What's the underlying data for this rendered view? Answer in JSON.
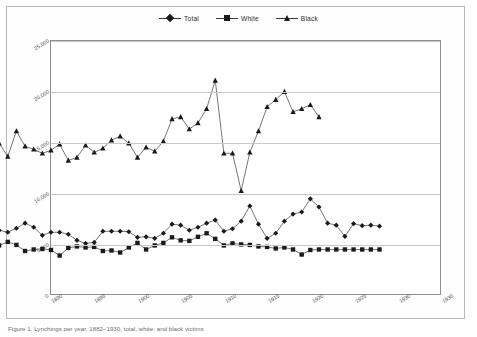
{
  "figure": {
    "caption": "Figure 1. Lynchings per year, 1882–1930, total, white, and black victims"
  },
  "legend": {
    "position": "top-center",
    "items": [
      {
        "label": "Total",
        "marker": "diamond",
        "color": "#1a1a1a"
      },
      {
        "label": "White",
        "marker": "square",
        "color": "#1a1a1a"
      },
      {
        "label": "Black",
        "marker": "triangle",
        "color": "#1a1a1a"
      }
    ]
  },
  "axes": {
    "y_ticks": [
      "0",
      "5,000",
      "10,000",
      "15,000",
      "20,000",
      "25,000"
    ],
    "x_ticks": [
      "1890",
      "1895",
      "1900",
      "1905",
      "1910",
      "1915",
      "1920",
      "1925",
      "1930",
      "1935"
    ],
    "grid": true
  },
  "chart_data": {
    "type": "line",
    "title": "",
    "xlabel": "",
    "ylabel": "",
    "xlim": [
      1890,
      1935
    ],
    "ylim": [
      0,
      25000
    ],
    "ytick_values": [
      0,
      5000,
      10000,
      15000,
      20000,
      25000
    ],
    "xtick_values": [
      1890,
      1895,
      1900,
      1905,
      1910,
      1915,
      1920,
      1925,
      1930,
      1935
    ],
    "grid": true,
    "legend_position": "top-center",
    "x": [
      1884,
      1885,
      1886,
      1887,
      1888,
      1889,
      1890,
      1891,
      1892,
      1893,
      1894,
      1895,
      1896,
      1897,
      1898,
      1899,
      1900,
      1901,
      1902,
      1903,
      1904,
      1905,
      1906,
      1907,
      1908,
      1909,
      1910,
      1911,
      1912,
      1913,
      1914,
      1915,
      1916,
      1917,
      1918,
      1919,
      1920,
      1921,
      1922,
      1923,
      1924,
      1925,
      1926,
      1927,
      1928
    ],
    "series": [
      {
        "name": "Total",
        "marker": "diamond",
        "color": "#1a1a1a",
        "values": [
          6300,
          6100,
          6500,
          7000,
          6600,
          5800,
          6100,
          6100,
          5900,
          5300,
          5000,
          5100,
          6200,
          6200,
          6200,
          6150,
          5600,
          5650,
          5500,
          6000,
          6900,
          6800,
          6300,
          6600,
          7000,
          7300,
          6200,
          6450,
          7200,
          8700,
          6900,
          5500,
          6000,
          7200,
          7900,
          8100,
          9400,
          8600,
          7000,
          6800,
          5700,
          6950,
          6750,
          6800,
          6700
        ],
        "values_note": "read from diamond markers against 5,000-interval gridlines"
      },
      {
        "name": "White",
        "marker": "square",
        "color": "#1a1a1a",
        "values": [
          4800,
          5150,
          4850,
          4250,
          4400,
          4450,
          4350,
          3800,
          4550,
          4700,
          4600,
          4650,
          4250,
          4300,
          4100,
          4600,
          5050,
          4400,
          4800,
          5050,
          5600,
          5300,
          5250,
          5650,
          6000,
          5450,
          4800,
          5000,
          4900,
          4850,
          4700,
          4650,
          4500,
          4600,
          4400,
          3900,
          4350,
          4400,
          4400,
          4400,
          4400,
          4400,
          4400,
          4400,
          4400
        ],
        "values_note": "read from square markers; lowest of the three series"
      },
      {
        "name": "Black",
        "marker": "triangle",
        "color": "#1a1a1a",
        "values": [
          14900,
          13600,
          16100,
          14600,
          14300,
          13900,
          14200,
          14800,
          13200,
          13500,
          14700,
          14000,
          14400,
          15200,
          15600,
          14900,
          13500,
          14500,
          14100,
          15100,
          17300,
          17500,
          16300,
          16900,
          18300,
          21100,
          13900,
          13900,
          10200,
          14000,
          16100,
          18500,
          19200,
          20000,
          18000,
          18300,
          18700,
          17500,
          null,
          null,
          null,
          null,
          null,
          null,
          null
        ],
        "values_note": "highest series; peak ~21,100 at 1909-1918 spike, trough ~10,200 at 1920"
      }
    ]
  }
}
